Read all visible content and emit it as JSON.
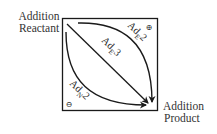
{
  "diagram": {
    "reactant_label": {
      "line1": "Addition",
      "line2": "Reactant"
    },
    "product_label": {
      "line1": "Addition",
      "line2": "Product"
    },
    "pathways": [
      {
        "id": "electrophilic-bimolecular",
        "label_main": "Ad",
        "label_sub": "E",
        "label_num": "2",
        "charge": "⊕"
      },
      {
        "id": "electrophilic-termolecular",
        "label_main": "Ad",
        "label_sub": "E",
        "label_num": "3"
      },
      {
        "id": "nucleophilic-bimolecular",
        "label_main": "Ad",
        "label_sub": "N",
        "label_num": "2",
        "charge": "⊖"
      }
    ],
    "colors": {
      "line": "#1a1a1a",
      "text": "#333333",
      "background": "#ffffff"
    }
  }
}
